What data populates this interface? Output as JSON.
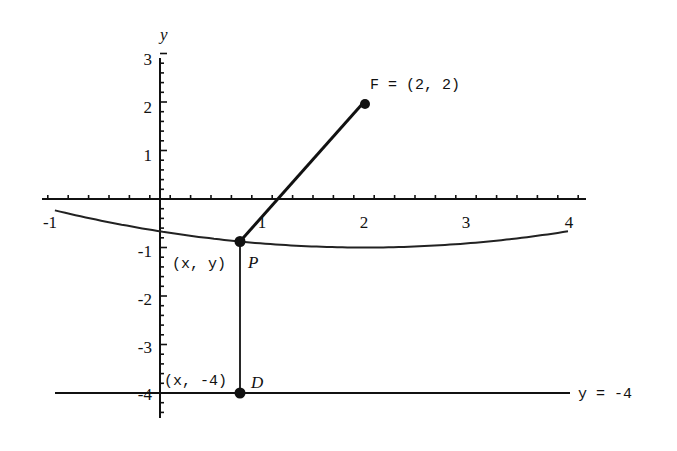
{
  "chart_data": {
    "type": "diagram",
    "title": "",
    "xlabel": "",
    "ylabel": "y",
    "xlim": [
      -1.15,
      4.2
    ],
    "ylim": [
      -4.5,
      3
    ],
    "x_ticks": [
      "-1",
      "1",
      "2",
      "3",
      "4"
    ],
    "y_ticks": [
      "3",
      "2",
      "1",
      "-1",
      "-2",
      "-3",
      "-4"
    ],
    "focus": {
      "label": "F = (2, 2)",
      "x": 2,
      "y": 2
    },
    "directrix": {
      "label": "y = -4",
      "y": -4
    },
    "parabola": {
      "equation": "y = (x-2)^2/12 - 1",
      "x_range": [
        -1.0,
        4.0
      ]
    },
    "point_P": {
      "label": "P",
      "coord_label": "(x, y)",
      "x": 0.78,
      "y": -0.876
    },
    "point_D": {
      "label": "D",
      "coord_label": "(x, -4)",
      "x": 0.78,
      "y": -4
    },
    "segments": [
      {
        "from": "P",
        "to": "F",
        "weight": "bold"
      },
      {
        "from": "P",
        "to": "D",
        "weight": "thin"
      }
    ]
  },
  "labels": {
    "y_axis": "y",
    "focus": "F = (2, 2)",
    "directrix": "y = -4",
    "P": "P",
    "P_coord": "(x, y)",
    "D": "D",
    "D_coord": "(x, -4)"
  },
  "ticks": {
    "x": [
      "-1",
      "1",
      "2",
      "3",
      "4"
    ],
    "y": [
      "3",
      "2",
      "1",
      "-1",
      "-2",
      "-3",
      "-4"
    ]
  }
}
